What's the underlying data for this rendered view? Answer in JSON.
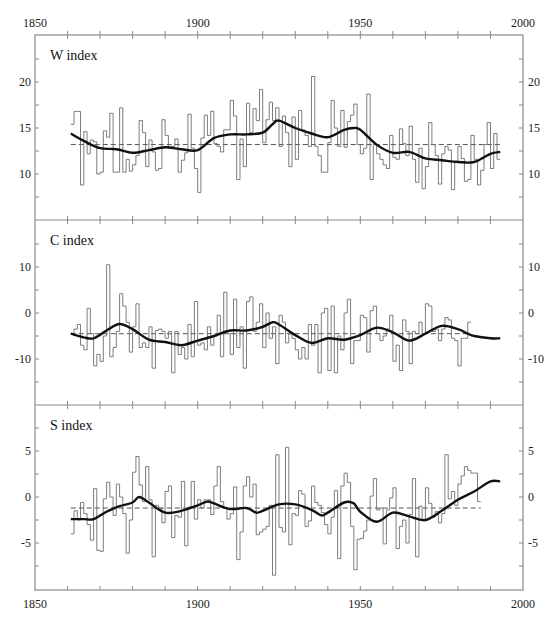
{
  "chart_data": [
    {
      "type": "line",
      "title": "W index",
      "xlabel": "",
      "ylabel": "",
      "xlim": [
        1850,
        2000
      ],
      "ylim": [
        5,
        25
      ],
      "yticks": [
        10,
        15,
        20
      ],
      "ytick_labels": [
        "10",
        "15",
        "20"
      ],
      "mean": 13.2,
      "x_start": 1861,
      "series": [
        {
          "name": "annual (step)",
          "values": [
            15.4,
            16.8,
            16.8,
            8.8,
            14.6,
            12.2,
            13.7,
            13.5,
            10.0,
            10.2,
            14.7,
            14.0,
            16.6,
            10.2,
            10.2,
            17.2,
            10.2,
            11.6,
            10.3,
            11.0,
            12.0,
            15.8,
            14.5,
            10.8,
            13.7,
            12.4,
            10.4,
            10.6,
            15.9,
            14.2,
            12.8,
            13.0,
            13.8,
            10.2,
            11.5,
            12.3,
            16.5,
            12.8,
            10.6,
            8.0,
            13.9,
            16.4,
            14.2,
            16.8,
            13.3,
            13.0,
            12.4,
            14.8,
            14.8,
            18.0,
            16.3,
            9.4,
            13.8,
            10.8,
            17.7,
            14.5,
            17.1,
            15.8,
            19.2,
            13.4,
            15.9,
            17.8,
            15.8,
            17.2,
            13.0,
            16.3,
            14.5,
            10.8,
            16.2,
            11.6,
            16.9,
            14.8,
            14.2,
            13.0,
            20.6,
            13.0,
            12.0,
            10.2,
            10.2,
            13.4,
            18.0,
            15.0,
            13.0,
            16.9,
            12.9,
            15.7,
            16.4,
            17.6,
            13.2,
            12.2,
            12.8,
            18.7,
            9.4,
            13.2,
            12.2,
            11.6,
            11.0,
            10.6,
            14.2,
            11.8,
            11.6,
            14.9,
            13.3,
            12.0,
            15.2,
            11.6,
            9.1,
            12.8,
            8.4,
            10.8,
            15.6,
            13.2,
            12.0,
            8.9,
            12.2,
            13.0,
            12.6,
            8.3,
            11.4,
            13.0,
            11.7,
            9.2,
            9.4,
            14.2,
            11.6,
            8.8,
            10.4,
            13.2,
            15.6,
            10.6,
            14.4,
            11.6
          ]
        },
        {
          "name": "smoothed",
          "x": [
            1861,
            1865,
            1870,
            1875,
            1880,
            1885,
            1890,
            1895,
            1900,
            1905,
            1910,
            1915,
            1920,
            1923,
            1925,
            1930,
            1935,
            1940,
            1945,
            1948,
            1950,
            1955,
            1960,
            1965,
            1970,
            1975,
            1980,
            1985,
            1990,
            1993
          ],
          "values": [
            14.4,
            13.6,
            12.8,
            12.7,
            12.3,
            12.6,
            12.9,
            12.7,
            12.6,
            13.9,
            14.3,
            14.3,
            14.5,
            15.4,
            15.8,
            15.0,
            14.4,
            14.0,
            14.8,
            15.0,
            14.8,
            13.2,
            12.3,
            12.4,
            11.7,
            11.5,
            11.3,
            11.3,
            12.2,
            12.4
          ]
        }
      ]
    },
    {
      "type": "line",
      "title": "C index",
      "xlabel": "",
      "ylabel": "",
      "xlim": [
        1850,
        2000
      ],
      "ylim": [
        -20,
        20
      ],
      "yticks": [
        -10,
        0,
        10
      ],
      "ytick_labels": [
        "-10",
        "0",
        "10"
      ],
      "mean": -4.5,
      "x_start": 1861,
      "series": [
        {
          "name": "annual (step)",
          "values": [
            -4.5,
            -3.5,
            -2.5,
            -7.0,
            -8.0,
            1.0,
            -4.5,
            -11.5,
            -9.0,
            -10.5,
            -5.0,
            10.5,
            -9.5,
            -7.5,
            -4.0,
            4.2,
            1.5,
            -2.0,
            -8.5,
            -3.0,
            2.0,
            -7.5,
            -6.5,
            -7.5,
            -3.0,
            -12.0,
            -3.8,
            -3.5,
            -4.0,
            -5.5,
            -4.0,
            -13.0,
            -4.0,
            -9.0,
            -7.5,
            -10.0,
            -2.5,
            -9.5,
            2.5,
            -7.0,
            -6.5,
            -8.0,
            -3.0,
            -7.0,
            -5.0,
            -0.5,
            -9.5,
            4.5,
            -4.5,
            -9.0,
            3.0,
            -7.5,
            -3.0,
            -12.0,
            2.5,
            3.5,
            -4.0,
            -2.0,
            2.0,
            -7.5,
            0.0,
            -5.5,
            -3.0,
            -11.0,
            -0.5,
            -2.0,
            -6.5,
            -4.5,
            -5.5,
            -8.0,
            -10.0,
            -7.5,
            -10.0,
            -2.5,
            -7.0,
            -2.5,
            -13.0,
            0.0,
            1.0,
            -12.5,
            1.5,
            -13.0,
            -5.0,
            -8.0,
            0.0,
            3.0,
            -11.0,
            -6.0,
            -6.0,
            -0.5,
            -1.0,
            -8.5,
            0.5,
            1.5,
            -4.5,
            -6.0,
            -5.0,
            -3.5,
            -0.5,
            -10.5,
            -7.0,
            -12.5,
            -1.5,
            -4.0,
            -11.0,
            -4.0,
            -4.5,
            -2.0,
            -4.5,
            2.0,
            1.5,
            -4.0,
            -3.5,
            -6.0,
            -3.5,
            -1.0,
            -1.5,
            -5.5,
            -6.0,
            -11.5,
            -5.5,
            -5.5,
            -2.0
          ]
        },
        {
          "name": "smoothed",
          "x": [
            1861,
            1865,
            1868,
            1872,
            1876,
            1880,
            1885,
            1890,
            1895,
            1900,
            1905,
            1910,
            1915,
            1920,
            1923,
            1925,
            1930,
            1935,
            1940,
            1945,
            1950,
            1955,
            1960,
            1965,
            1970,
            1975,
            1980,
            1983,
            1985,
            1990,
            1993
          ],
          "values": [
            -4.5,
            -5.3,
            -5.5,
            -3.8,
            -2.4,
            -3.5,
            -5.8,
            -6.3,
            -7.0,
            -6.0,
            -5.0,
            -3.8,
            -3.8,
            -3.0,
            -2.0,
            -2.5,
            -4.8,
            -6.5,
            -5.5,
            -5.8,
            -4.8,
            -3.2,
            -4.2,
            -6.0,
            -4.5,
            -2.8,
            -3.5,
            -4.5,
            -5.0,
            -5.5,
            -5.5
          ]
        }
      ]
    },
    {
      "type": "line",
      "title": "S index",
      "xlabel": "",
      "ylabel": "",
      "xlim": [
        1850,
        2000
      ],
      "ylim": [
        -10,
        10
      ],
      "yticks": [
        -5,
        0,
        5
      ],
      "ytick_labels": [
        "-5",
        "0",
        "5"
      ],
      "xticks": [
        1850,
        1900,
        1950,
        2000
      ],
      "xtick_labels": [
        "1850",
        "1900",
        "1950",
        "2000"
      ],
      "mean": -1.2,
      "x_start": 1861,
      "series": [
        {
          "name": "annual (step)",
          "values": [
            -4.0,
            -1.5,
            -2.5,
            -0.6,
            -1.8,
            -3.0,
            -4.7,
            0.9,
            -5.8,
            -5.9,
            -0.2,
            1.6,
            0.0,
            -2.0,
            1.4,
            0.0,
            -1.8,
            -6.1,
            -2.5,
            2.7,
            4.4,
            1.3,
            -0.5,
            3.3,
            -0.3,
            -6.5,
            -0.9,
            -1.2,
            -2.8,
            0.6,
            1.2,
            -4.4,
            -2.0,
            -2.2,
            1.7,
            -5.3,
            -1.1,
            1.7,
            -2.4,
            -0.3,
            -1.2,
            -0.3,
            -0.3,
            -1.9,
            1.2,
            3.3,
            -0.5,
            -1.2,
            -2.4,
            -1.8,
            1.1,
            -6.8,
            -3.8,
            1.2,
            2.2,
            0.0,
            1.4,
            -4.1,
            -3.8,
            -3.5,
            -3.2,
            -0.9,
            -8.5,
            4.6,
            -3.3,
            -3.8,
            5.4,
            -5.2,
            -1.8,
            -2.0,
            0.7,
            0.3,
            -3.2,
            -2.6,
            1.2,
            -0.6,
            -0.9,
            -1.7,
            -3.0,
            -4.0,
            -2.2,
            0.7,
            -6.7,
            1.2,
            2.6,
            1.6,
            -3.2,
            -7.9,
            -4.6,
            -4.5,
            -3.7,
            -2.5,
            0.1,
            2.0,
            -1.4,
            -1.2,
            -5.1,
            -1.4,
            -0.1,
            1.0,
            -5.6,
            -3.2,
            -2.5,
            -5.0,
            -1.9,
            2.0,
            -6.5,
            -1.0,
            -2.6,
            1.0,
            -0.7,
            -2.2,
            -1.6,
            -2.8,
            -1.8,
            4.6,
            -0.2,
            0.6,
            -0.9,
            1.4,
            2.3,
            3.3,
            2.9,
            2.6,
            2.6,
            -0.5
          ]
        },
        {
          "name": "smoothed",
          "x": [
            1861,
            1865,
            1868,
            1872,
            1876,
            1880,
            1882,
            1885,
            1890,
            1895,
            1900,
            1903,
            1905,
            1910,
            1915,
            1918,
            1920,
            1925,
            1930,
            1935,
            1938,
            1940,
            1945,
            1948,
            1950,
            1955,
            1960,
            1965,
            1970,
            1975,
            1980,
            1985,
            1990,
            1993
          ],
          "values": [
            -2.4,
            -2.4,
            -2.4,
            -1.6,
            -1.0,
            -0.6,
            0.0,
            -0.6,
            -1.7,
            -1.5,
            -0.9,
            -0.5,
            -0.7,
            -1.3,
            -1.2,
            -1.7,
            -1.5,
            -0.8,
            -0.8,
            -1.4,
            -2.0,
            -1.7,
            -0.6,
            -0.7,
            -1.6,
            -2.7,
            -1.7,
            -2.1,
            -2.5,
            -1.5,
            -0.3,
            0.6,
            1.7,
            1.7
          ]
        }
      ]
    }
  ],
  "axes": {
    "top_xticks": [
      1850,
      1900,
      1950,
      2000
    ],
    "top_xtick_labels": [
      "1850",
      "1900",
      "1950",
      "2000"
    ],
    "bottom_xticks": [
      1850,
      1900,
      1950,
      2000
    ],
    "bottom_xtick_labels": [
      "1850",
      "1900",
      "1950",
      "2000"
    ],
    "minor_xtick_step": 10
  },
  "panels": {
    "w_title": "W index",
    "c_title": "C index",
    "s_title": "S index"
  },
  "colors": {
    "frame": "#8a8a8a",
    "step": "#6e6e6e",
    "smooth": "#111111",
    "mean": "#555555",
    "text": "#222222"
  }
}
